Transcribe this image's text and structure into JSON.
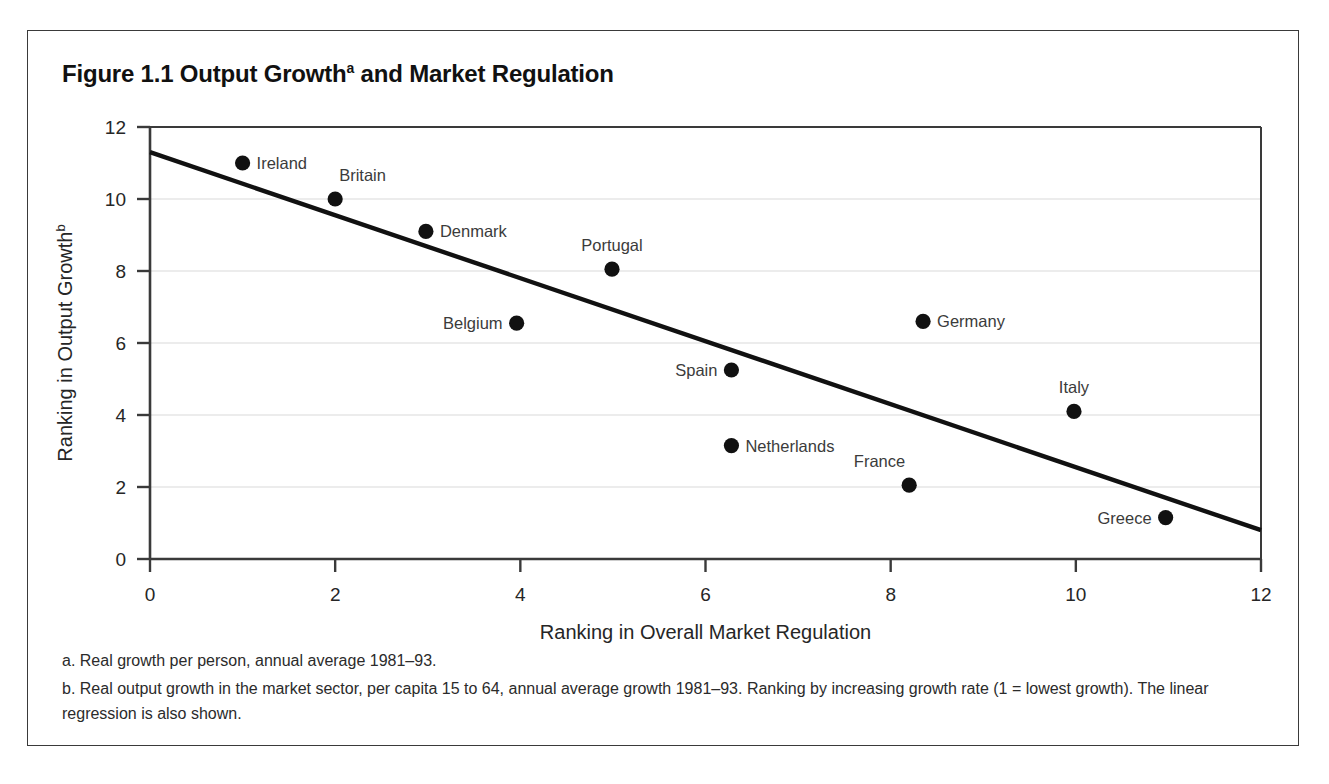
{
  "figure": {
    "title_main": "Figure 1.1 Output Growth",
    "title_sup": "a",
    "title_rest": " and Market Regulation"
  },
  "footnotes": {
    "a": "a. Real growth per person, annual average 1981–93.",
    "b": "b. Real output growth in the market sector, per capita 15 to 64, annual average growth 1981–93. Ranking by increasing growth rate (1 = lowest growth). The linear regression is also shown."
  },
  "colors": {
    "frame": "#3a3a3a",
    "axis": "#3a3a3a",
    "gridline": "#d9d9d9",
    "marker": "#111111",
    "regression": "#111111",
    "text": "#262626",
    "label_text": "#3b3b3b",
    "background": "#ffffff"
  },
  "chart_data": {
    "type": "scatter",
    "xlabel": "Ranking in Overall Market Regulation",
    "ylabel": "Ranking in Output Growthᵇ",
    "ylabel_text": "Ranking in Output Growth",
    "ylabel_sup": "b",
    "xlim": [
      0,
      12
    ],
    "ylim": [
      0,
      12
    ],
    "xticks": [
      0,
      2,
      4,
      6,
      8,
      10,
      12
    ],
    "yticks": [
      0,
      2,
      4,
      6,
      8,
      10,
      12
    ],
    "grid": "horizontal",
    "legend": "none",
    "points": [
      {
        "name": "Ireland",
        "x": 1.0,
        "y": 11.0,
        "label_pos": "right"
      },
      {
        "name": "Britain",
        "x": 2.0,
        "y": 10.0,
        "label_pos": "above-right"
      },
      {
        "name": "Denmark",
        "x": 2.98,
        "y": 9.1,
        "label_pos": "right"
      },
      {
        "name": "Portugal",
        "x": 4.99,
        "y": 8.05,
        "label_pos": "above"
      },
      {
        "name": "Germany",
        "x": 8.35,
        "y": 6.6,
        "label_pos": "right"
      },
      {
        "name": "Belgium",
        "x": 3.96,
        "y": 6.55,
        "label_pos": "left"
      },
      {
        "name": "Spain",
        "x": 6.28,
        "y": 5.25,
        "label_pos": "left"
      },
      {
        "name": "Italy",
        "x": 9.98,
        "y": 4.1,
        "label_pos": "above"
      },
      {
        "name": "Netherlands",
        "x": 6.28,
        "y": 3.15,
        "label_pos": "right"
      },
      {
        "name": "France",
        "x": 8.2,
        "y": 2.05,
        "label_pos": "above-left"
      },
      {
        "name": "Greece",
        "x": 10.97,
        "y": 1.15,
        "label_pos": "left"
      }
    ],
    "regression_line": {
      "label": "linear regression",
      "x0": 0.0,
      "y0": 11.3,
      "x1": 12.0,
      "y1": 0.8
    }
  }
}
